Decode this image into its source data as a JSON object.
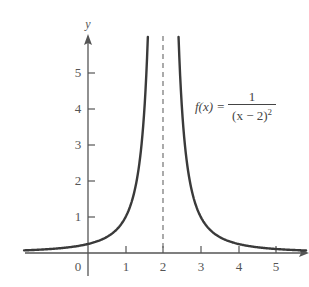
{
  "chart_data": {
    "type": "line",
    "title": "",
    "function": "f(x) = 1/(x-2)^2",
    "formula_label": {
      "lhs": "f(x) =",
      "numerator": "1",
      "denominator": "(x − 2)",
      "exponent": "2"
    },
    "xlabel": "",
    "ylabel": "y",
    "x_ticks": [
      "0",
      "1",
      "2",
      "3",
      "4",
      "5"
    ],
    "y_ticks": [
      "1",
      "2",
      "3",
      "4",
      "5"
    ],
    "xlim": [
      -1.7,
      5.8
    ],
    "ylim": [
      0,
      6
    ],
    "asymptote": {
      "x": 2,
      "style": "dashed"
    },
    "grid": false,
    "legend": "none",
    "series": [
      {
        "name": "f(x) = 1/(x-2)^2",
        "x": [
          -1.7,
          -1,
          0,
          0.5,
          1,
          1.2,
          1.4,
          1.5,
          1.59,
          2.41,
          2.5,
          2.6,
          2.8,
          3,
          3.5,
          4,
          5,
          5.8
        ],
        "y": [
          0.07,
          0.11,
          0.25,
          0.44,
          1.0,
          1.56,
          2.78,
          4.0,
          6.0,
          6.0,
          4.0,
          2.78,
          1.56,
          1.0,
          0.44,
          0.25,
          0.11,
          0.07
        ]
      }
    ]
  },
  "axes": {
    "y_axis_label": "y",
    "x_tick_labels": [
      "0",
      "1",
      "2",
      "3",
      "4",
      "5"
    ],
    "y_tick_labels": [
      "1",
      "2",
      "3",
      "4",
      "5"
    ]
  }
}
